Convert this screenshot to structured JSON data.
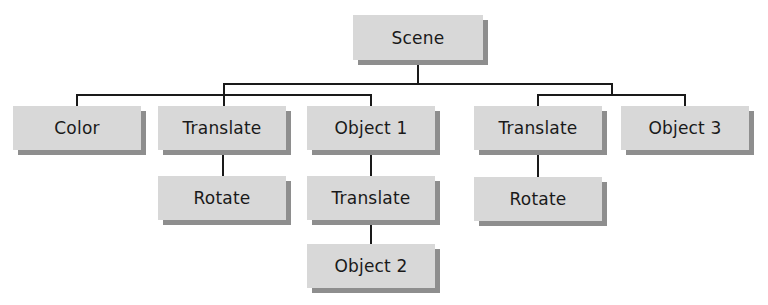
{
  "diagram": {
    "type": "scene-graph-tree",
    "colors": {
      "node_fill": "#d8d8d8",
      "node_shadow": "#8e8e8e",
      "line": "#1a1a1a",
      "text": "#1a1a1a"
    },
    "nodes": {
      "scene": {
        "label": "Scene"
      },
      "color": {
        "label": "Color"
      },
      "translate_left": {
        "label": "Translate"
      },
      "rotate_left": {
        "label": "Rotate"
      },
      "object1": {
        "label": "Object 1"
      },
      "translate_mid": {
        "label": "Translate"
      },
      "object2": {
        "label": "Object 2"
      },
      "translate_right": {
        "label": "Translate"
      },
      "rotate_right": {
        "label": "Rotate"
      },
      "object3": {
        "label": "Object 3"
      }
    },
    "edges": [
      [
        "Scene",
        "Color"
      ],
      [
        "Scene",
        "Translate"
      ],
      [
        "Scene",
        "Object 1"
      ],
      [
        "Scene",
        "Translate"
      ],
      [
        "Scene",
        "Object 3"
      ],
      [
        "Translate",
        "Rotate"
      ],
      [
        "Object 1",
        "Translate"
      ],
      [
        "Translate",
        "Object 2"
      ],
      [
        "Translate",
        "Rotate"
      ]
    ]
  }
}
